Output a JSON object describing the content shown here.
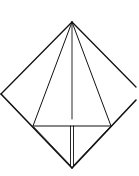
{
  "diagram": {
    "type": "origami-fold-diagram",
    "background": "#ffffff",
    "stroke_color": "#111111",
    "shape": "diamond-with-kite-folds"
  }
}
